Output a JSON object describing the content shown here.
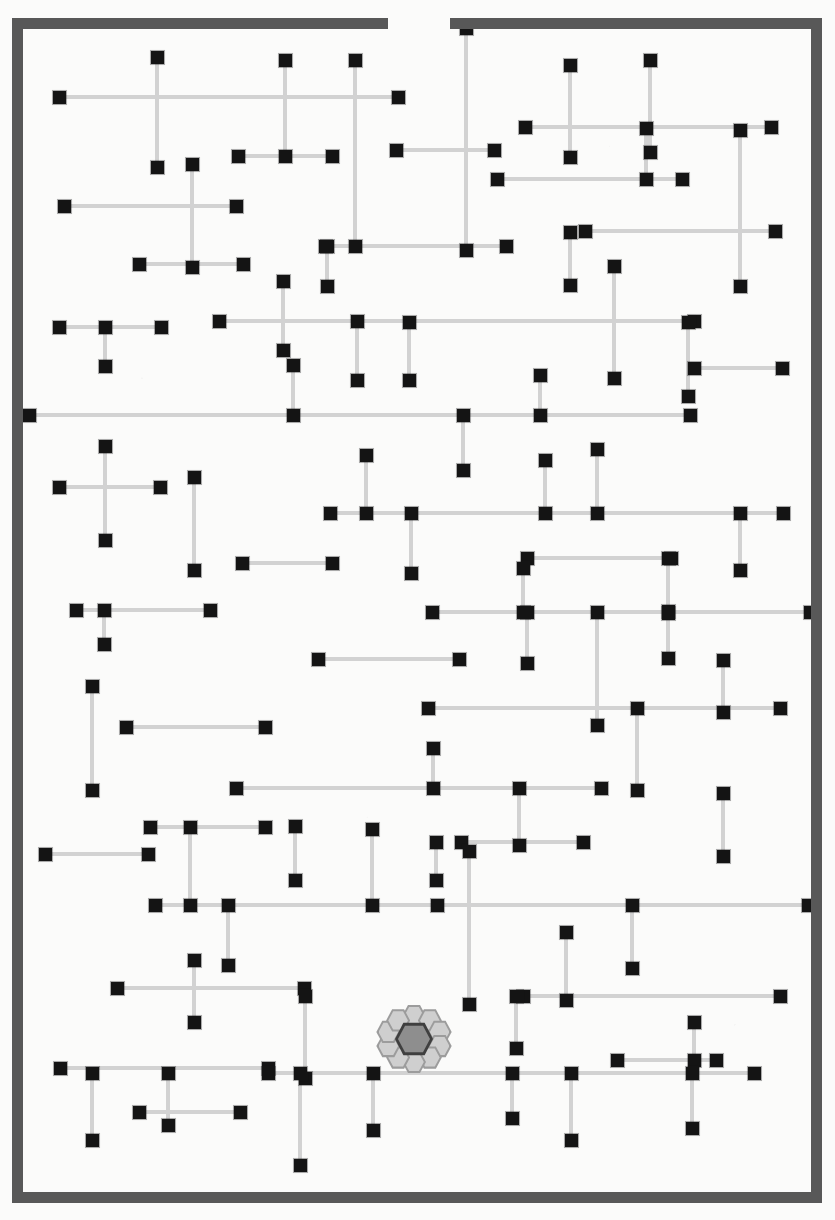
{
  "figure": {
    "title": "Enclosed orthogonal segment field with central hexagonal rosette",
    "caption": "",
    "width": 835,
    "height": 1220,
    "background_color": "#fbfbfa"
  },
  "palette": {
    "wall_color": "#585858",
    "segment_color": "#d2d2d2",
    "node_color": "#141414",
    "rosette_outer_hex_fill": "#cfcfcf",
    "rosette_outer_hex_stroke": "#4a4a4a",
    "rosette_core_fill": "#8e8e8e",
    "rosette_core_stroke": "#3f3f3f"
  },
  "enclosure": {
    "name": "boundary-wall",
    "thickness": 11,
    "bounds": {
      "left": 12,
      "top": 18,
      "right": 822,
      "bottom": 1203
    },
    "walls": [
      {
        "id": "wall-top-left",
        "side": "top",
        "x": 12,
        "y": 18,
        "w": 376,
        "h": 11
      },
      {
        "id": "wall-top-right",
        "side": "top",
        "x": 450,
        "y": 18,
        "w": 372,
        "h": 11
      },
      {
        "id": "wall-left",
        "side": "left",
        "x": 12,
        "y": 18,
        "w": 11,
        "h": 1185
      },
      {
        "id": "wall-right",
        "side": "right",
        "x": 811,
        "y": 18,
        "w": 11,
        "h": 1185
      },
      {
        "id": "wall-bottom",
        "side": "bottom",
        "x": 12,
        "y": 1192,
        "w": 810,
        "h": 11
      }
    ],
    "openings": [
      {
        "id": "gap-top",
        "side": "top",
        "x": 388,
        "w": 62
      }
    ]
  },
  "rosette": {
    "name": "hexagon-rosette",
    "center": {
      "x": 414,
      "y": 1039
    },
    "outer_hex_count": 10,
    "core_shape": "hexagon",
    "outer_hex_radius": 12,
    "ring_radius": 25
  },
  "chart_data": {
    "type": "scatter",
    "title": "Enclosed orthogonal segment field with central hexagonal rosette",
    "xlabel": "",
    "ylabel": "",
    "xlim": [
      0,
      835
    ],
    "ylim": [
      0,
      1220
    ],
    "grid": false,
    "legend": null,
    "note": "Light-grey axis-aligned segments, each terminated at both ends by a small filled black square node.",
    "segments": [
      {
        "o": "h",
        "x1": 59,
        "x2": 398,
        "y": 97
      },
      {
        "o": "v",
        "y1": 57,
        "y2": 167,
        "x": 157
      },
      {
        "o": "h",
        "x1": 238,
        "x2": 332,
        "y": 156
      },
      {
        "o": "v",
        "y1": 60,
        "y2": 156,
        "x": 285
      },
      {
        "o": "v",
        "y1": 60,
        "y2": 246,
        "x": 355
      },
      {
        "o": "h",
        "x1": 396,
        "x2": 494,
        "y": 150
      },
      {
        "o": "v",
        "y1": 28,
        "y2": 250,
        "x": 466
      },
      {
        "o": "h",
        "x1": 525,
        "x2": 771,
        "y": 127
      },
      {
        "o": "v",
        "y1": 65,
        "y2": 157,
        "x": 570
      },
      {
        "o": "v",
        "y1": 60,
        "y2": 152,
        "x": 650
      },
      {
        "o": "h",
        "x1": 497,
        "x2": 682,
        "y": 179
      },
      {
        "o": "v",
        "y1": 128,
        "y2": 179,
        "x": 646
      },
      {
        "o": "v",
        "y1": 130,
        "y2": 286,
        "x": 740
      },
      {
        "o": "h",
        "x1": 64,
        "x2": 236,
        "y": 206
      },
      {
        "o": "v",
        "y1": 164,
        "y2": 267,
        "x": 192
      },
      {
        "o": "h",
        "x1": 139,
        "x2": 243,
        "y": 264
      },
      {
        "o": "h",
        "x1": 325,
        "x2": 506,
        "y": 246
      },
      {
        "o": "v",
        "y1": 246,
        "y2": 286,
        "x": 327
      },
      {
        "o": "h",
        "x1": 585,
        "x2": 775,
        "y": 231
      },
      {
        "o": "v",
        "y1": 232,
        "y2": 285,
        "x": 570
      },
      {
        "o": "v",
        "y1": 266,
        "y2": 378,
        "x": 614
      },
      {
        "o": "h",
        "x1": 59,
        "x2": 161,
        "y": 327
      },
      {
        "o": "v",
        "y1": 327,
        "y2": 366,
        "x": 105
      },
      {
        "o": "h",
        "x1": 219,
        "x2": 694,
        "y": 321
      },
      {
        "o": "v",
        "y1": 281,
        "y2": 350,
        "x": 283
      },
      {
        "o": "v",
        "y1": 321,
        "y2": 380,
        "x": 357
      },
      {
        "o": "v",
        "y1": 322,
        "y2": 380,
        "x": 409
      },
      {
        "o": "v",
        "y1": 322,
        "y2": 396,
        "x": 688
      },
      {
        "o": "h",
        "x1": 29,
        "x2": 690,
        "y": 415
      },
      {
        "o": "v",
        "y1": 365,
        "y2": 415,
        "x": 293
      },
      {
        "o": "v",
        "y1": 415,
        "y2": 470,
        "x": 463
      },
      {
        "o": "v",
        "y1": 375,
        "y2": 415,
        "x": 540
      },
      {
        "o": "h",
        "x1": 694,
        "x2": 782,
        "y": 368
      },
      {
        "o": "h",
        "x1": 59,
        "x2": 160,
        "y": 487
      },
      {
        "o": "v",
        "y1": 446,
        "y2": 540,
        "x": 105
      },
      {
        "o": "v",
        "y1": 477,
        "y2": 570,
        "x": 194
      },
      {
        "o": "h",
        "x1": 330,
        "x2": 783,
        "y": 513
      },
      {
        "o": "v",
        "y1": 455,
        "y2": 513,
        "x": 366
      },
      {
        "o": "v",
        "y1": 513,
        "y2": 573,
        "x": 411
      },
      {
        "o": "v",
        "y1": 460,
        "y2": 513,
        "x": 545
      },
      {
        "o": "v",
        "y1": 449,
        "y2": 513,
        "x": 597
      },
      {
        "o": "v",
        "y1": 513,
        "y2": 570,
        "x": 740
      },
      {
        "o": "h",
        "x1": 242,
        "x2": 332,
        "y": 563
      },
      {
        "o": "h",
        "x1": 527,
        "x2": 671,
        "y": 558
      },
      {
        "o": "v",
        "y1": 558,
        "y2": 613,
        "x": 668
      },
      {
        "o": "h",
        "x1": 76,
        "x2": 210,
        "y": 610
      },
      {
        "o": "v",
        "y1": 610,
        "y2": 644,
        "x": 104
      },
      {
        "o": "h",
        "x1": 432,
        "x2": 810,
        "y": 612
      },
      {
        "o": "v",
        "y1": 568,
        "y2": 612,
        "x": 523
      },
      {
        "o": "v",
        "y1": 612,
        "y2": 663,
        "x": 527
      },
      {
        "o": "h",
        "x1": 318,
        "x2": 459,
        "y": 659
      },
      {
        "o": "v",
        "y1": 612,
        "y2": 725,
        "x": 597
      },
      {
        "o": "v",
        "y1": 611,
        "y2": 658,
        "x": 668
      },
      {
        "o": "h",
        "x1": 428,
        "x2": 780,
        "y": 708
      },
      {
        "o": "v",
        "y1": 686,
        "y2": 790,
        "x": 92
      },
      {
        "o": "h",
        "x1": 126,
        "x2": 265,
        "y": 727
      },
      {
        "o": "v",
        "y1": 660,
        "y2": 712,
        "x": 723
      },
      {
        "o": "v",
        "y1": 708,
        "y2": 790,
        "x": 637
      },
      {
        "o": "h",
        "x1": 236,
        "x2": 601,
        "y": 788
      },
      {
        "o": "v",
        "y1": 748,
        "y2": 788,
        "x": 433
      },
      {
        "o": "v",
        "y1": 788,
        "y2": 845,
        "x": 519
      },
      {
        "o": "h",
        "x1": 150,
        "x2": 265,
        "y": 827
      },
      {
        "o": "v",
        "y1": 827,
        "y2": 905,
        "x": 190
      },
      {
        "o": "h",
        "x1": 45,
        "x2": 148,
        "y": 854
      },
      {
        "o": "v",
        "y1": 826,
        "y2": 880,
        "x": 295
      },
      {
        "o": "v",
        "y1": 829,
        "y2": 905,
        "x": 372
      },
      {
        "o": "h",
        "x1": 461,
        "x2": 583,
        "y": 842
      },
      {
        "o": "v",
        "y1": 842,
        "y2": 880,
        "x": 436
      },
      {
        "o": "v",
        "y1": 851,
        "y2": 1004,
        "x": 469
      },
      {
        "o": "v",
        "y1": 793,
        "y2": 856,
        "x": 723
      },
      {
        "o": "h",
        "x1": 155,
        "x2": 437,
        "y": 905
      },
      {
        "o": "v",
        "y1": 905,
        "y2": 965,
        "x": 228
      },
      {
        "o": "h",
        "x1": 437,
        "x2": 808,
        "y": 905
      },
      {
        "o": "v",
        "y1": 932,
        "y2": 1000,
        "x": 566
      },
      {
        "o": "v",
        "y1": 905,
        "y2": 968,
        "x": 632
      },
      {
        "o": "h",
        "x1": 117,
        "x2": 304,
        "y": 988
      },
      {
        "o": "v",
        "y1": 960,
        "y2": 1022,
        "x": 194
      },
      {
        "o": "h",
        "x1": 523,
        "x2": 780,
        "y": 996
      },
      {
        "o": "v",
        "y1": 996,
        "y2": 1048,
        "x": 516
      },
      {
        "o": "v",
        "y1": 996,
        "y2": 1078,
        "x": 305
      },
      {
        "o": "h",
        "x1": 617,
        "x2": 716,
        "y": 1060
      },
      {
        "o": "v",
        "y1": 1022,
        "y2": 1060,
        "x": 694
      },
      {
        "o": "h",
        "x1": 60,
        "x2": 268,
        "y": 1068
      },
      {
        "o": "h",
        "x1": 268,
        "x2": 754,
        "y": 1073
      },
      {
        "o": "v",
        "y1": 1073,
        "y2": 1118,
        "x": 512
      },
      {
        "o": "v",
        "y1": 1073,
        "y2": 1140,
        "x": 571
      },
      {
        "o": "v",
        "y1": 1073,
        "y2": 1128,
        "x": 692
      },
      {
        "o": "v",
        "y1": 1073,
        "y2": 1125,
        "x": 168
      },
      {
        "o": "h",
        "x1": 139,
        "x2": 240,
        "y": 1112
      },
      {
        "o": "v",
        "y1": 1073,
        "y2": 1140,
        "x": 92
      },
      {
        "o": "v",
        "y1": 1073,
        "y2": 1130,
        "x": 373
      },
      {
        "o": "v",
        "y1": 1073,
        "y2": 1165,
        "x": 300
      }
    ],
    "node_count": 180
  }
}
